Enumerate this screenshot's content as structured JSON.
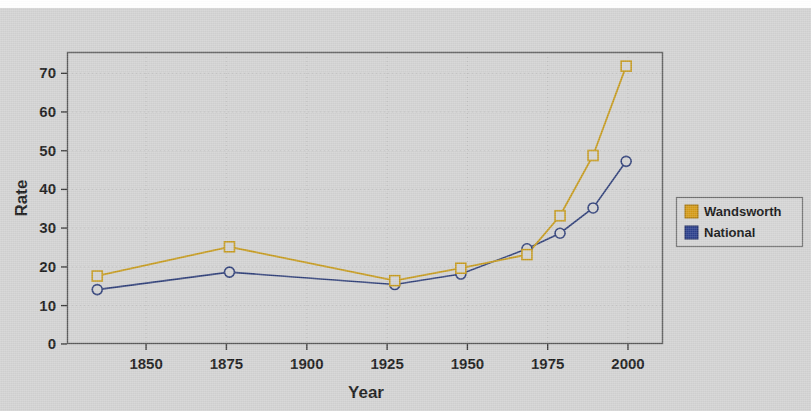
{
  "chart_data": {
    "type": "line",
    "title": "",
    "xlabel": "Year",
    "ylabel": "Rate",
    "xlim": [
      1832,
      2012
    ],
    "ylim": [
      0,
      75
    ],
    "xticks": [
      "1850",
      "1875",
      "1900",
      "1925",
      "1950",
      "1975",
      "2000"
    ],
    "xtick_values": [
      1850,
      1875,
      1900,
      1925,
      1950,
      1975,
      2000
    ],
    "yticks": [
      "0",
      "10",
      "20",
      "30",
      "40",
      "50",
      "60",
      "70"
    ],
    "ytick_values": [
      0,
      10,
      20,
      30,
      40,
      50,
      60,
      70
    ],
    "grid": true,
    "legend_position": "right",
    "x": [
      1841,
      1881,
      1931,
      1951,
      1971,
      1981,
      1991,
      2001
    ],
    "series": [
      {
        "name": "Wandsworth",
        "color": "#c59a1e",
        "marker": "square",
        "values": [
          17.5,
          25.0,
          16.3,
          19.5,
          23.0,
          33.0,
          48.5,
          71.5
        ]
      },
      {
        "name": "National",
        "color": "#2f3f78",
        "marker": "circle",
        "values": [
          14.0,
          18.5,
          15.3,
          18.0,
          24.5,
          28.5,
          35.0,
          47.0
        ]
      }
    ]
  },
  "legend": {
    "items": [
      {
        "label": "Wandsworth",
        "color": "#d49a16"
      },
      {
        "label": "National",
        "color": "#2b3f8c"
      }
    ]
  },
  "colors": {
    "background": "#d2d2d2",
    "plot_frame": "#595959",
    "wandsworth": "#c59a1e",
    "national": "#2f3f78",
    "text": "#1a1a1a"
  }
}
